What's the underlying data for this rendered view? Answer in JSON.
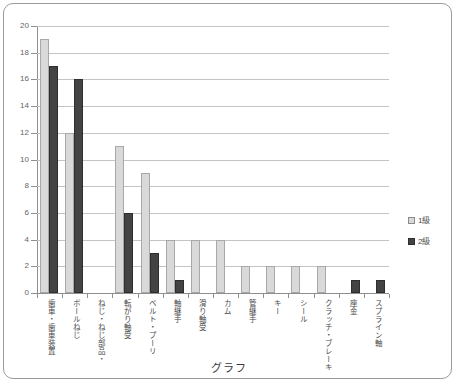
{
  "chart_data": {
    "type": "bar",
    "title": "グラフ",
    "xlabel": "",
    "ylabel": "",
    "ylim": [
      0,
      20
    ],
    "ytick_step": 2,
    "yticks": [
      20,
      18,
      16,
      14,
      12,
      10,
      8,
      6,
      4,
      2,
      0
    ],
    "grid": true,
    "legend_position": "right",
    "categories": [
      "歯車・歯車装置",
      "ボールねじ",
      "ねじ・ねじ部品・",
      "転がり軸受",
      "ベルト・プーリ",
      "軸継手",
      "滑り軸受",
      "カム",
      "管継手",
      "キー",
      "シール",
      "クラッチ・ブレーキ",
      "座金",
      "スプライン軸"
    ],
    "series": [
      {
        "name": "1級",
        "color": "#d9d9d9",
        "values": [
          19,
          12,
          0,
          11,
          9,
          4,
          4,
          4,
          2,
          2,
          2,
          2,
          0,
          0
        ]
      },
      {
        "name": "2級",
        "color": "#434343",
        "values": [
          17,
          16,
          0,
          6,
          3,
          1,
          0,
          0,
          0,
          0,
          0,
          0,
          1,
          1
        ]
      }
    ]
  },
  "legend": {
    "items": [
      {
        "label": "1級",
        "series": "a"
      },
      {
        "label": "2級",
        "series": "b"
      }
    ]
  }
}
